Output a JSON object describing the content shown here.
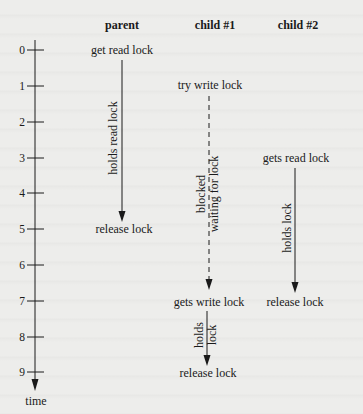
{
  "headers": {
    "parent": "parent",
    "child1": "child #1",
    "child2": "child #2"
  },
  "axis": {
    "label": "time",
    "ticks": [
      "0",
      "1",
      "2",
      "3",
      "4",
      "5",
      "6",
      "7",
      "8",
      "9"
    ]
  },
  "parent": {
    "start": "get read lock",
    "during": "holds read lock",
    "end": "release lock"
  },
  "child1": {
    "start": "try write lock",
    "blocked_line1": "blocked",
    "blocked_line2": "waiting for lock",
    "acquired": "gets write lock",
    "holds_line1": "holds",
    "holds_line2": "lock",
    "end": "release lock"
  },
  "child2": {
    "start": "gets read lock",
    "during": "holds lock",
    "end": "release lock"
  },
  "colors": {
    "background": "#ededeb",
    "ink": "#1a1a1a"
  }
}
